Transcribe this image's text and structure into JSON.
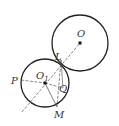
{
  "diagram": {
    "type": "geometry",
    "colors": {
      "stroke": "#222222",
      "aux": "#555555",
      "background": "#ffffff"
    },
    "circles": [
      {
        "name": "big",
        "center_label": "O",
        "cx": 80,
        "cy": 43,
        "r": 28
      },
      {
        "name": "small",
        "center_label": "O1",
        "cx": 45,
        "cy": 83,
        "r": 24
      }
    ],
    "points": {
      "O": {
        "label": "O",
        "x": 80,
        "y": 43
      },
      "O1": {
        "label": "O",
        "sub": "1",
        "x": 45,
        "y": 83
      },
      "L": {
        "label": "L",
        "x": 61,
        "y": 60
      },
      "P": {
        "label": "P",
        "x": 21,
        "y": 80
      },
      "Q": {
        "label": "Q",
        "x": 63,
        "y": 85
      },
      "M": {
        "label": "M",
        "x": 57,
        "y": 107
      }
    },
    "labels": {
      "O": "O",
      "O1_main": "O",
      "O1_sub": "1",
      "L": "L",
      "P": "P",
      "Q": "Q",
      "M": "M"
    }
  }
}
